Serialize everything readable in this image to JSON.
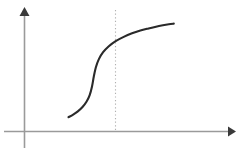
{
  "figure": {
    "background_color": "#ffffff",
    "width": 246,
    "height": 151,
    "title": "",
    "axis_color": "#9a9a9a",
    "curve_color": "#2a2a2a",
    "guide_color": "#b0b0b0"
  },
  "axes": {
    "x_axis": {
      "label": "",
      "start_x": 4,
      "end_x": 234,
      "y": 131,
      "has_arrow": true,
      "arrow_direction": "right",
      "tick_labels": []
    },
    "y_axis": {
      "label": "",
      "x": 24,
      "start_y": 148,
      "end_y": 10,
      "has_arrow": true,
      "arrow_direction": "up",
      "tick_labels": []
    }
  },
  "guide_line": {
    "name": "threshold-line",
    "orientation": "vertical",
    "x": 115,
    "top_y": 10,
    "bottom_y": 131,
    "style": "dotted",
    "label": ""
  },
  "chart_data": {
    "type": "line",
    "title": "",
    "xlabel": "",
    "ylabel": "",
    "grid": false,
    "legend": null,
    "xlim": [
      0,
      1
    ],
    "ylim": [
      0,
      1
    ],
    "series": [
      {
        "name": "sigmoid",
        "style": "solid",
        "color": "#2a2a2a",
        "inflection_x": 0.445,
        "x": [
          0.279,
          0.311,
          0.343,
          0.375,
          0.402,
          0.424,
          0.44,
          0.452,
          0.466,
          0.487,
          0.516,
          0.555,
          0.602,
          0.657,
          0.714,
          0.771,
          0.827,
          0.878,
          0.925,
          0.966,
          1.0
        ],
        "y": [
          0.12,
          0.143,
          0.172,
          0.21,
          0.256,
          0.315,
          0.392,
          0.478,
          0.56,
          0.634,
          0.695,
          0.748,
          0.793,
          0.831,
          0.862,
          0.886,
          0.905,
          0.921,
          0.933,
          0.942,
          0.948
        ]
      }
    ],
    "annotations": [
      {
        "type": "vertical-line",
        "x": 0.445,
        "style": "dotted",
        "text": ""
      }
    ]
  }
}
